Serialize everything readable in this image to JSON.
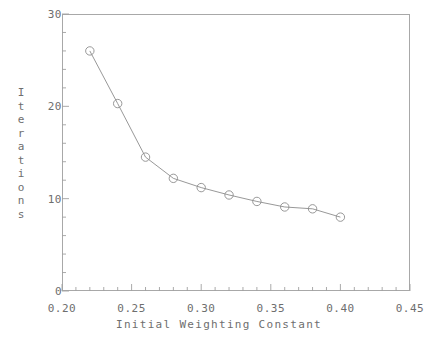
{
  "chart_data": {
    "type": "line",
    "title": "",
    "subtitle": "",
    "xlabel": "Initial Weighting Constant",
    "ylabel": "Iterations",
    "xlim": [
      0.2,
      0.45
    ],
    "ylim": [
      0,
      30
    ],
    "grid": false,
    "legend": null,
    "marker": "open-circle",
    "line_color": "#8c8c8c",
    "marker_color": "#8c8c8c",
    "x_ticks": [
      0.2,
      0.25,
      0.3,
      0.35,
      0.4,
      0.45
    ],
    "x_tick_labels": [
      "0.20",
      "0.25",
      "0.30",
      "0.35",
      "0.40",
      "0.45"
    ],
    "x_minor_tick_step": 0.01,
    "y_ticks": [
      0,
      10,
      20,
      30
    ],
    "y_tick_labels": [
      "0",
      "10",
      "20",
      "30"
    ],
    "y_minor_tick_step": 2,
    "x": [
      0.22,
      0.24,
      0.26,
      0.28,
      0.3,
      0.32,
      0.34,
      0.36,
      0.38,
      0.4
    ],
    "values": [
      26.0,
      20.3,
      14.5,
      12.2,
      11.2,
      10.4,
      9.7,
      9.1,
      8.9,
      8.0
    ],
    "series": [
      {
        "name": "Iterations vs Initial Weighting Constant",
        "x": [
          0.22,
          0.24,
          0.26,
          0.28,
          0.3,
          0.32,
          0.34,
          0.36,
          0.38,
          0.4
        ],
        "values": [
          26.0,
          20.3,
          14.5,
          12.2,
          11.2,
          10.4,
          9.7,
          9.1,
          8.9,
          8.0
        ]
      }
    ]
  },
  "axes": {
    "y_title_letters": [
      "I",
      "t",
      "e",
      "r",
      "a",
      "t",
      "i",
      "o",
      "n",
      "s"
    ]
  }
}
